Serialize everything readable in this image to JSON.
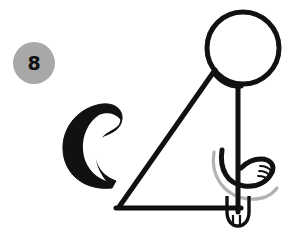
{
  "figure": {
    "badge": {
      "name": "step-number-badge",
      "label": "8",
      "fill_color": "#a8a8a8",
      "text_color": "#111111"
    },
    "background_color": "#ffffff",
    "ink_color": "#111111",
    "guide_color": "#b0b0b0",
    "parts": [
      {
        "id": "head",
        "label": "head-circle",
        "shape": "circle",
        "cx": 243,
        "cy": 48,
        "r": 36
      },
      {
        "id": "back",
        "label": "back-curve",
        "shape": "curve"
      },
      {
        "id": "body",
        "label": "body-triangle",
        "shape": "triangle"
      },
      {
        "id": "front-leg",
        "label": "front-leg",
        "shape": "line"
      },
      {
        "id": "ground",
        "label": "ground-line",
        "shape": "line"
      },
      {
        "id": "paw",
        "label": "front-paw",
        "shape": "rounded-foot"
      },
      {
        "id": "tail",
        "label": "curled-tail",
        "shape": "crescent"
      },
      {
        "id": "hind-leg",
        "label": "hind-leg-curve",
        "shape": "curve"
      },
      {
        "id": "hind-paw",
        "label": "hind-paw-with-toes",
        "shape": "curl"
      },
      {
        "id": "guide-arc",
        "label": "construction-guide-arc",
        "shape": "arc"
      }
    ]
  }
}
